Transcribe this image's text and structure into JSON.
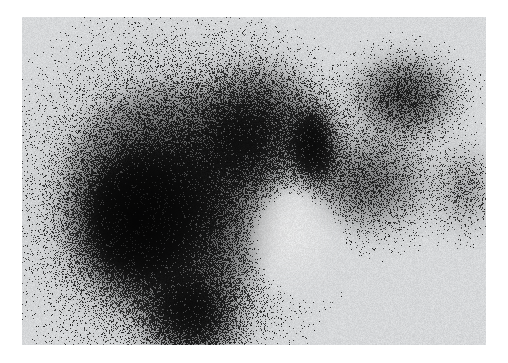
{
  "document": {
    "kind": "scintigraphy-scan-image",
    "modality_label": "",
    "caption": ""
  },
  "page": {
    "width": 508,
    "height": 363,
    "background_color": "#ffffff"
  },
  "scan_plate": {
    "x": 22,
    "y": 17,
    "width": 464,
    "height": 328,
    "film_base_color": "#eceef0",
    "activity_color": "#1a1a1a",
    "border": "none"
  },
  "noise": {
    "type": "speckle",
    "description": "gamma-camera photon counting grain",
    "density": 0.55,
    "dot_size_px": 1.4,
    "seed": 20240517
  },
  "regions": [
    {
      "name": "main-uptake-mass",
      "anatomy_label": "liver",
      "center_x": 148,
      "center_y": 185,
      "radius_x": 108,
      "radius_y": 118,
      "intensity": 0.95
    },
    {
      "name": "dense-core",
      "anatomy_label": "liver-dense-core",
      "center_x": 112,
      "center_y": 205,
      "radius_x": 52,
      "radius_y": 62,
      "intensity": 1.0
    },
    {
      "name": "inferior-tip",
      "anatomy_label": "liver-inferior-tip",
      "center_x": 170,
      "center_y": 300,
      "radius_x": 48,
      "radius_y": 44,
      "intensity": 0.82
    },
    {
      "name": "central-lobe",
      "anatomy_label": "mid-abdominal-uptake",
      "center_x": 235,
      "center_y": 110,
      "radius_x": 62,
      "radius_y": 60,
      "intensity": 0.72
    },
    {
      "name": "focal-hot-band",
      "anatomy_label": "focal-intense-uptake",
      "center_x": 292,
      "center_y": 128,
      "radius_x": 22,
      "radius_y": 38,
      "intensity": 0.98
    },
    {
      "name": "right-upper-uptake",
      "anatomy_label": "spleen",
      "center_x": 382,
      "center_y": 80,
      "radius_x": 48,
      "radius_y": 38,
      "intensity": 0.66
    },
    {
      "name": "right-mid-diffuse",
      "anatomy_label": "right-diffuse-activity",
      "center_x": 345,
      "center_y": 165,
      "radius_x": 60,
      "radius_y": 48,
      "intensity": 0.5
    },
    {
      "name": "far-right-faint",
      "anatomy_label": "faint-peripheral-activity",
      "center_x": 443,
      "center_y": 172,
      "radius_x": 26,
      "radius_y": 40,
      "intensity": 0.3
    },
    {
      "name": "cold-defect",
      "anatomy_label": "photopenic-region",
      "center_x": 268,
      "center_y": 215,
      "radius_x": 44,
      "radius_y": 48,
      "intensity": 0.0
    }
  ],
  "annotations": {
    "markers": [],
    "scale_bar": "",
    "orientation_labels": []
  }
}
